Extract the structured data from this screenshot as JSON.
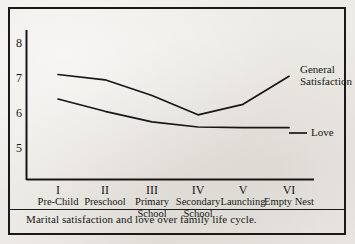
{
  "figure": {
    "caption": "Marital satisfaction and love over family life cycle.",
    "border_color": "#1b1a18",
    "background_color": "#edebe6",
    "ink_color": "#171614"
  },
  "axis": {
    "y_ticks": [
      "8",
      "7",
      "6",
      "5"
    ],
    "x_roman": [
      "I",
      "II",
      "III",
      "IV",
      "V",
      "VI"
    ],
    "x_stages": [
      "Pre-Child",
      "Preschool",
      "Primary School",
      "Secondary School",
      "Launching",
      "Empty Nest"
    ]
  },
  "legend": {
    "general_satisfaction_line1": "General",
    "general_satisfaction_line2": "Satisfaction",
    "love": "Love"
  },
  "chart_data": {
    "type": "line",
    "title": "Marital satisfaction and love over family life cycle.",
    "xlabel": "",
    "ylabel": "",
    "ylim": [
      4.6,
      8.4
    ],
    "yticks": [
      5,
      6,
      7,
      8
    ],
    "grid": false,
    "legend_position": "right-inline",
    "categories": [
      "I",
      "II",
      "III",
      "IV",
      "V",
      "VI"
    ],
    "category_names": [
      "Pre-Child",
      "Preschool",
      "Primary School",
      "Secondary School",
      "Launching",
      "Empty Nest"
    ],
    "series": [
      {
        "name": "General Satisfaction",
        "values": [
          7.1,
          6.95,
          6.5,
          5.95,
          6.25,
          7.05
        ]
      },
      {
        "name": "Love",
        "values": [
          6.4,
          6.05,
          5.75,
          5.6,
          5.58,
          5.58
        ]
      }
    ]
  }
}
